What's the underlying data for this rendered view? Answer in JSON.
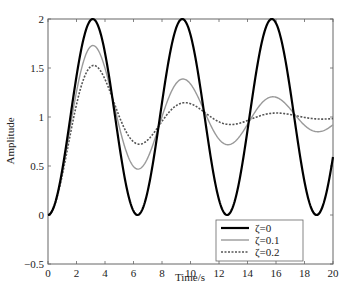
{
  "chart_data": {
    "type": "line",
    "title": "",
    "xlabel": "Time/s",
    "ylabel": "Amplitude",
    "xlim": [
      0,
      20
    ],
    "ylim": [
      -0.5,
      2
    ],
    "xticks": [
      0,
      2,
      4,
      6,
      8,
      10,
      12,
      14,
      16,
      18,
      20
    ],
    "yticks": [
      -0.5,
      0,
      0.5,
      1,
      1.5,
      2
    ],
    "ytick_labels": [
      "−0.5",
      "0",
      "0.5",
      "1",
      "1.5",
      "2"
    ],
    "grid": false,
    "legend_position": "lower right",
    "x": [
      0,
      1,
      2,
      3,
      4,
      5,
      6,
      7,
      8,
      9,
      10,
      11,
      12,
      13,
      14,
      15,
      16,
      17,
      18,
      19,
      20
    ],
    "series": [
      {
        "name": "ζ=0",
        "zeta": 0,
        "wn": 1,
        "color": "#000000",
        "style": "solid",
        "width": 2.2,
        "values": [
          0,
          0.46,
          1.42,
          1.99,
          1.65,
          0.72,
          0.04,
          0.25,
          1.15,
          1.91,
          1.84,
          1.0,
          0.16,
          0.09,
          0.86,
          1.76,
          1.96,
          1.28,
          0.34,
          0.01,
          0.59
        ]
      },
      {
        "name": "ζ=0.1",
        "zeta": 0.1,
        "wn": 1,
        "color": "#9a9a9a",
        "style": "solid",
        "width": 1.4,
        "values": [
          0,
          0.44,
          1.31,
          1.72,
          1.43,
          0.82,
          0.51,
          0.71,
          1.16,
          1.37,
          1.24,
          0.95,
          0.81,
          0.92,
          1.12,
          1.21,
          1.12,
          0.96,
          0.91,
          0.98,
          1.07
        ]
      },
      {
        "name": "ζ=0.2",
        "zeta": 0.2,
        "wn": 1,
        "color": "#555555",
        "style": "dashed",
        "width": 1.6,
        "values": [
          0,
          0.43,
          1.22,
          1.52,
          1.27,
          0.88,
          0.74,
          0.88,
          1.08,
          1.14,
          1.05,
          0.96,
          0.95,
          1.0,
          1.04,
          1.03,
          0.99,
          0.98,
          0.99,
          1.01,
          1.01
        ]
      }
    ]
  }
}
